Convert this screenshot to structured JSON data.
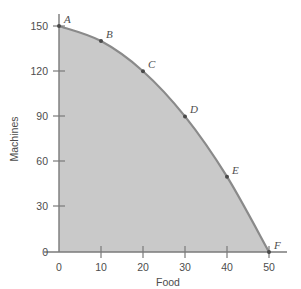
{
  "chart_data": {
    "type": "line",
    "title": "",
    "subtitle": "",
    "xlabel": "Food",
    "ylabel": "Machines",
    "xlim": [
      0,
      50
    ],
    "ylim": [
      0,
      150
    ],
    "xticks": [
      0,
      10,
      20,
      30,
      40,
      50
    ],
    "yticks": [
      0,
      30,
      60,
      90,
      120,
      150
    ],
    "xtick_labels": [
      "0",
      "10",
      "20",
      "30",
      "40",
      "50"
    ],
    "ytick_labels": [
      "0",
      "30",
      "60",
      "90",
      "120",
      "150"
    ],
    "grid": false,
    "legend": "none",
    "fill_under_curve": true,
    "series": [
      {
        "name": "Production possibilities frontier",
        "x": [
          0,
          10,
          20,
          30,
          40,
          50
        ],
        "values": [
          150,
          140,
          120,
          90,
          50,
          0
        ],
        "point_labels": [
          "A",
          "B",
          "C",
          "D",
          "E",
          "F"
        ]
      }
    ],
    "annotations": [
      {
        "label": "A",
        "x": 0,
        "y": 150
      },
      {
        "label": "B",
        "x": 10,
        "y": 140
      },
      {
        "label": "C",
        "x": 20,
        "y": 120
      },
      {
        "label": "D",
        "x": 30,
        "y": 90
      },
      {
        "label": "E",
        "x": 40,
        "y": 50
      },
      {
        "label": "F",
        "x": 50,
        "y": 0
      }
    ],
    "colors": {
      "fill": "#c9c9c9",
      "curve": "#8a8a8a",
      "axis": "#7a7a7a",
      "text": "#4d4d4d",
      "dot": "#4a4a4a",
      "background": "#ffffff"
    }
  },
  "axes": {
    "y": {
      "title": "Machines",
      "ticks": [
        {
          "label": "150"
        },
        {
          "label": "120"
        },
        {
          "label": "90"
        },
        {
          "label": "60"
        },
        {
          "label": "30"
        },
        {
          "label": "0"
        }
      ]
    },
    "x": {
      "title": "Food",
      "ticks": [
        {
          "label": "0"
        },
        {
          "label": "10"
        },
        {
          "label": "20"
        },
        {
          "label": "30"
        },
        {
          "label": "40"
        },
        {
          "label": "50"
        }
      ]
    }
  },
  "points": [
    {
      "label": "A"
    },
    {
      "label": "B"
    },
    {
      "label": "C"
    },
    {
      "label": "D"
    },
    {
      "label": "E"
    },
    {
      "label": "F"
    }
  ]
}
